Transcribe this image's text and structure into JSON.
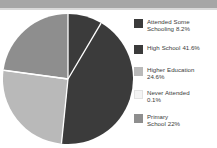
{
  "figure": {
    "background_color": "#ffffff",
    "top_band_color": "#a6a6a6"
  },
  "chart_data": {
    "type": "pie",
    "title": "",
    "subtitle": "",
    "xlabel": "",
    "ylabel": "",
    "grid": false,
    "legend_position": "right",
    "start_angle_deg": 0,
    "direction": "clockwise",
    "categories": [
      "Attended Some Schooling",
      "High School",
      "Higher Education",
      "Never Attended",
      "Primary School"
    ],
    "values": [
      8.2,
      41.6,
      24.6,
      0.1,
      22.0
    ],
    "value_unit": "%",
    "colors": [
      "#3b3b3b",
      "#3b3b3b",
      "#b9b9b9",
      "#f4f4f4",
      "#8e8e8e"
    ],
    "slice_separator_color": "#ffffff",
    "slices": [
      {
        "name": "Attended Some Schooling",
        "value": 8.2,
        "label": "Attended Some Schooling 8.2%",
        "color": "#3b3b3b"
      },
      {
        "name": "High School",
        "value": 41.6,
        "label": "High School 41.6%",
        "color": "#3b3b3b"
      },
      {
        "name": "Higher Education",
        "value": 24.6,
        "label": "Higher Education 24.6%",
        "color": "#b9b9b9"
      },
      {
        "name": "Never Attended",
        "value": 0.1,
        "label": "Never Attended 0.1%",
        "color": "#f4f4f4"
      },
      {
        "name": "Primary School",
        "value": 22.0,
        "label": "Primary School 22%",
        "color": "#8e8e8e"
      }
    ]
  },
  "legend": {
    "items": [
      {
        "text": "Attended Some Schooling 8.2%",
        "line1": "Attended Some",
        "line2": "Schooling 8.2%",
        "color": "#3b3b3b"
      },
      {
        "text": "High School 41.6%",
        "line1": "High School 41.6%",
        "line2": "",
        "color": "#3b3b3b"
      },
      {
        "text": "Higher Education 24.6%",
        "line1": "Higher Education",
        "line2": "24.6%",
        "color": "#b9b9b9"
      },
      {
        "text": "Never Attended 0.1%",
        "line1": "Never Attended",
        "line2": "0.1%",
        "color": "#f4f4f4"
      },
      {
        "text": "Primary School 22%",
        "line1": "Primary",
        "line2": "School 22%",
        "color": "#8e8e8e"
      }
    ]
  }
}
